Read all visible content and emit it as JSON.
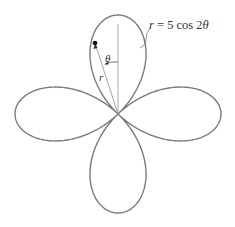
{
  "diagram": {
    "equation_label": "r = 5 cos 2θ",
    "equation_parts": {
      "r": "r",
      "rest": " = 5 cos 2",
      "theta": "θ"
    },
    "angle_label": "θ",
    "radius_label": "r",
    "curve": {
      "type": "polar-rose",
      "a": 5,
      "k": 2,
      "petals": 4
    },
    "colors": {
      "curve": "#7a7a7a",
      "lines": "#8a8a8a",
      "text": "#333333",
      "point": "#111111"
    }
  }
}
